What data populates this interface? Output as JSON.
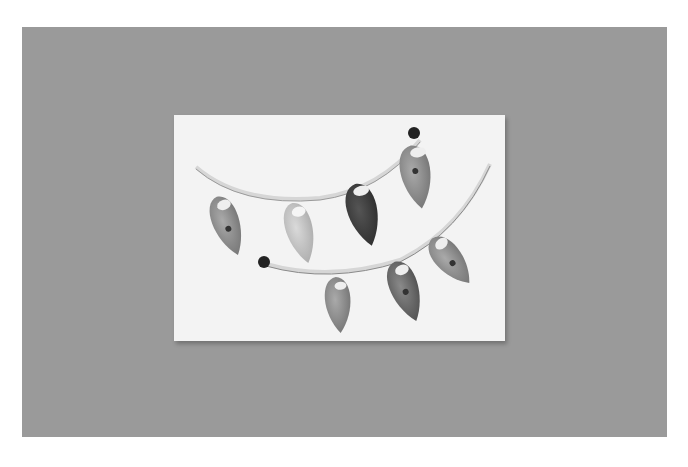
{
  "image": {
    "subject": "quilled paper leaf garland on white card",
    "background_color": "#9a9a9a",
    "card_color": "#f3f3f3",
    "elements": {
      "branches": 2,
      "leaves": 8,
      "beads": 2
    }
  }
}
